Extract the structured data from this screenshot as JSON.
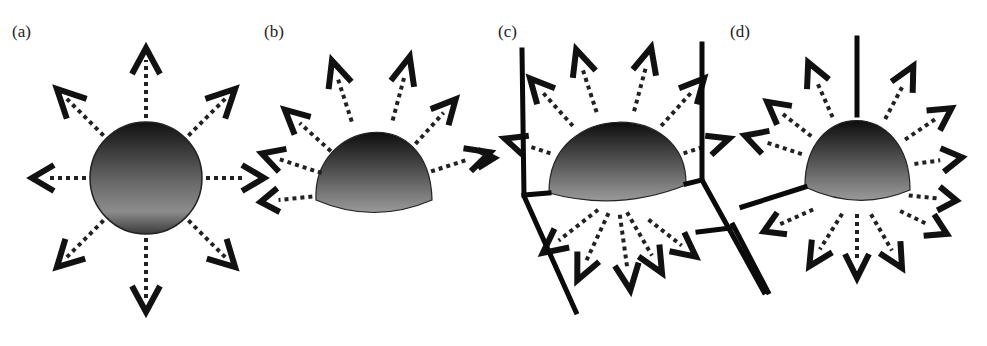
{
  "figure": {
    "panels": [
      {
        "id": "a",
        "label": "(a)",
        "shape": "sphere",
        "arrows": 8,
        "walls": "none"
      },
      {
        "id": "b",
        "label": "(b)",
        "shape": "spherical-cap",
        "arrows": 7,
        "walls": "none"
      },
      {
        "id": "c",
        "label": "(c)",
        "shape": "spherical-cap",
        "arrows": 10,
        "walls": "two-bent-walls"
      },
      {
        "id": "d",
        "label": "(d)",
        "shape": "spherical-cap",
        "arrows": 12,
        "walls": "three-lines"
      }
    ],
    "colors": {
      "arrow": "#111111",
      "drop_top": "#1a1a1a",
      "drop_bottom": "#8a8a8a",
      "background": "#ffffff"
    }
  }
}
